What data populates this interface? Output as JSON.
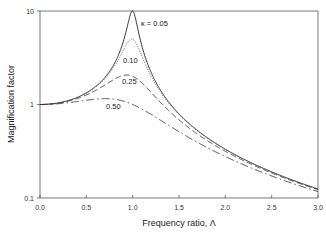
{
  "chart_data": {
    "type": "line",
    "title": "",
    "xlabel": "Frequency ratio, Λ",
    "ylabel": "Magnification factor",
    "xlim": [
      0.0,
      3.0
    ],
    "ylim": [
      0.1,
      10
    ],
    "yscale": "log",
    "grid": false,
    "legend_position": "inline labels near curves",
    "x_ticks": [
      "0.0",
      "0.5",
      "1.0",
      "1.5",
      "2.0",
      "2.5",
      "3.0"
    ],
    "y_ticks": [
      "0.1",
      "1",
      "10"
    ],
    "x": [
      0.0,
      0.25,
      0.5,
      0.75,
      0.9,
      1.0,
      1.1,
      1.25,
      1.5,
      2.0,
      2.5,
      3.0
    ],
    "series": [
      {
        "name": "κ = 0.05",
        "label": "κ = 0.05",
        "style": "solid",
        "values": [
          1.0,
          1.07,
          1.33,
          2.27,
          4.97,
          10.0,
          4.52,
          1.76,
          0.8,
          0.33,
          0.19,
          0.125
        ]
      },
      {
        "name": "0.10",
        "label": "0.10",
        "style": "dotted",
        "values": [
          1.0,
          1.07,
          1.32,
          2.18,
          4.17,
          5.0,
          3.94,
          1.72,
          0.79,
          0.33,
          0.19,
          0.125
        ]
      },
      {
        "name": "0.25",
        "label": "0.25",
        "style": "dashed",
        "values": [
          1.0,
          1.05,
          1.24,
          1.69,
          2.01,
          2.0,
          1.79,
          1.38,
          0.74,
          0.32,
          0.19,
          0.12
        ]
      },
      {
        "name": "0.50",
        "label": "0.50",
        "style": "dash-dot",
        "values": [
          1.0,
          1.01,
          1.08,
          1.14,
          1.11,
          1.0,
          0.88,
          0.76,
          0.55,
          0.28,
          0.17,
          0.12
        ]
      }
    ]
  },
  "axes": {
    "xlabel": "Frequency ratio, Λ",
    "ylabel": "Magnification factor",
    "x_ticks": [
      "0.0",
      "0.5",
      "1.0",
      "1.5",
      "2.0",
      "2.5",
      "3.0"
    ],
    "y_ticks": [
      "10",
      "1",
      "0.1"
    ]
  },
  "labels": {
    "k005": "κ = 0.05",
    "k010": "0.10",
    "k025": "0.25",
    "k050": "0.50"
  }
}
